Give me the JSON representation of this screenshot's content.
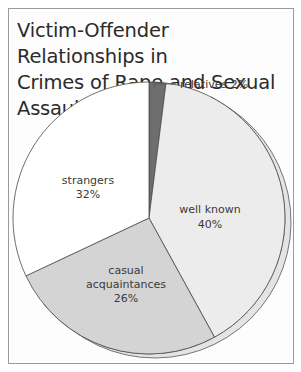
{
  "chart_data": {
    "type": "pie",
    "title": "Victim-Offender Relationships in Crimes of Rape and Sexual Assault",
    "title_lines": [
      "Victim-Offender Relationships in",
      "Crimes of Rape and Sexual Assault"
    ],
    "slices": [
      {
        "label": "relatives",
        "value": 2,
        "display": "relatives 2%",
        "color": "#6e6e6e"
      },
      {
        "label": "well known",
        "value": 40,
        "display": "40%",
        "color": "#ececec"
      },
      {
        "label": "casual acquaintances",
        "value": 26,
        "display": "26%",
        "color": "#d4d4d4"
      },
      {
        "label": "strangers",
        "value": 32,
        "display": "32%",
        "color": "#ffffff"
      }
    ],
    "start_angle_deg": -90,
    "direction": "clockwise",
    "legend": "none",
    "annotations": [
      "relatives 2% (callout line)"
    ]
  },
  "labels": {
    "relatives": "relatives 2%",
    "well_known_name": "well known",
    "well_known_pct": "40%",
    "casual_line1": "casual",
    "casual_line2": "acquaintances",
    "casual_pct": "26%",
    "strangers_name": "strangers",
    "strangers_pct": "32%"
  }
}
